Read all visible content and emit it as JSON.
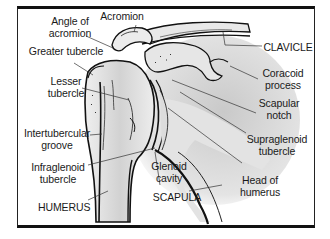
{
  "diagram": {
    "colors": {
      "border": "#111111",
      "bone_fill": "#e6e6e6",
      "bone_shadow": "#c8c8c8",
      "outline": "#1a1a1a",
      "leader_line": "#333333",
      "background": "#ffffff"
    },
    "labels": {
      "angle_of_acromion": {
        "line1": "Angle of",
        "line2": "acromion"
      },
      "acromion": "Acromion",
      "greater_tubercle": "Greater tubercle",
      "lesser_tubercle": {
        "line1": "Lesser",
        "line2": "tubercle"
      },
      "intertubercular_groove": {
        "line1": "Intertubercular",
        "line2": "groove"
      },
      "infraglenoid_tubercle": {
        "line1": "Infraglenoid",
        "line2": "tubercle"
      },
      "humerus": "HUMERUS",
      "clavicle": "CLAVICLE",
      "coracoid_process": {
        "line1": "Coracoid",
        "line2": "process"
      },
      "scapular_notch": {
        "line1": "Scapular",
        "line2": "notch"
      },
      "supraglenoid_tubercle": {
        "line1": "Supraglenoid",
        "line2": "tubercle"
      },
      "glenoid_cavity": {
        "line1": "Glenoid",
        "line2": "cavity"
      },
      "head_of_humerus": {
        "line1": "Head of",
        "line2": "humerus"
      },
      "scapula": "SCAPULA"
    }
  }
}
